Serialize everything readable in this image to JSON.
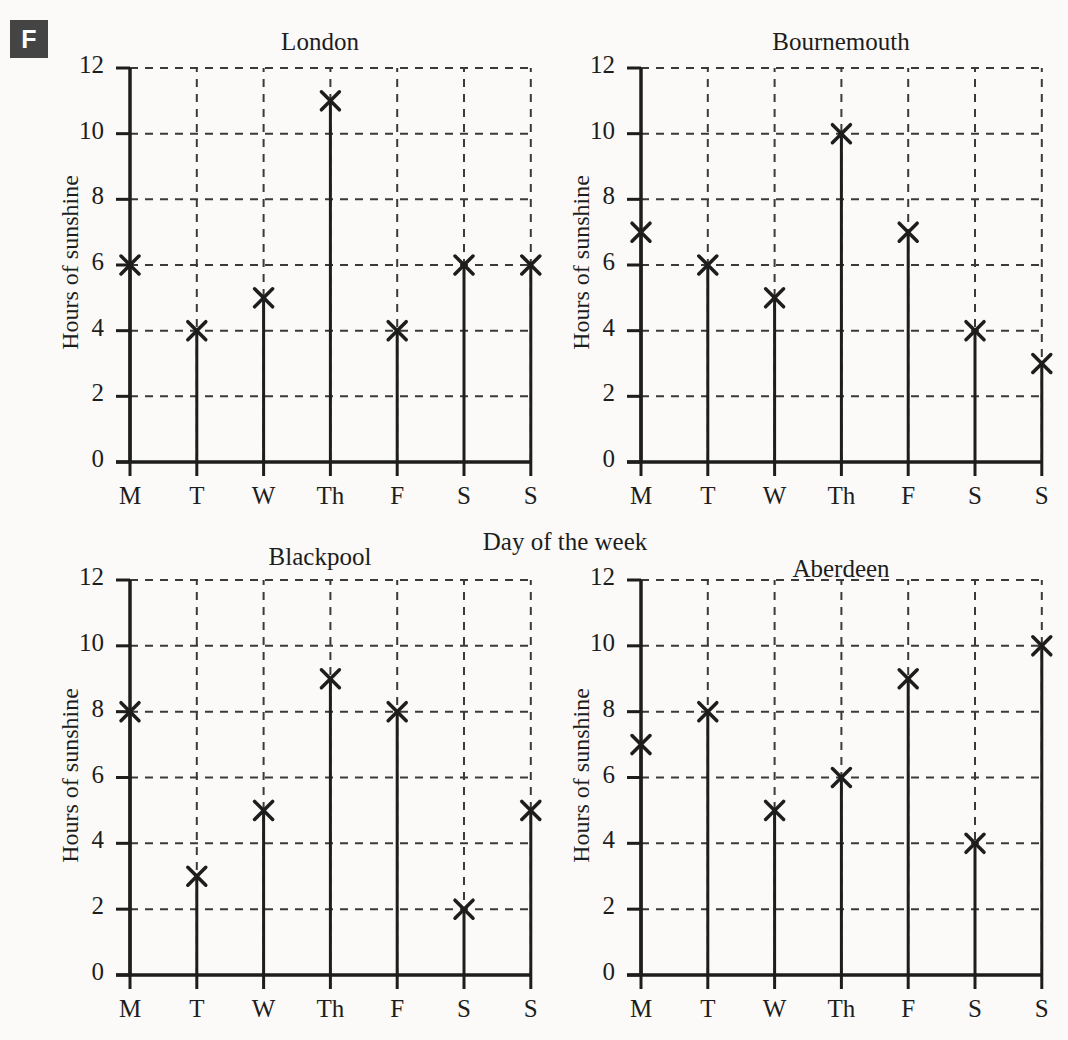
{
  "badge": {
    "label": "F"
  },
  "global": {
    "xaxis_label": "Day of the week",
    "yaxis_label": "Hours of sunshine",
    "categories": [
      "M",
      "T",
      "W",
      "Th",
      "F",
      "S",
      "S"
    ],
    "yticks": [
      "0",
      "2",
      "4",
      "6",
      "8",
      "10",
      "12"
    ],
    "marker": "x-marker",
    "ink_color": "#1d1d1d",
    "grid_color": "#3a3a3a",
    "background": "#fbfaf8",
    "badge_color": "#444444"
  },
  "chart_data": [
    {
      "type": "scatter",
      "title": "London",
      "xlabel": "Day of the week",
      "ylabel": "Hours of sunshine",
      "categories": [
        "M",
        "T",
        "W",
        "Th",
        "F",
        "S",
        "S"
      ],
      "values": [
        6,
        4,
        5,
        11,
        4,
        6,
        6
      ],
      "ylim": [
        0,
        12
      ],
      "ytick_step": 2,
      "grid": true,
      "legend": "none",
      "marker": "x",
      "stems": true
    },
    {
      "type": "scatter",
      "title": "Bournemouth",
      "xlabel": "Day of the week",
      "ylabel": "Hours of sunshine",
      "categories": [
        "M",
        "T",
        "W",
        "Th",
        "F",
        "S",
        "S"
      ],
      "values": [
        7,
        6,
        5,
        10,
        7,
        4,
        3
      ],
      "ylim": [
        0,
        12
      ],
      "ytick_step": 2,
      "grid": true,
      "legend": "none",
      "marker": "x",
      "stems": true
    },
    {
      "type": "scatter",
      "title": "Blackpool",
      "xlabel": "Day of the week",
      "ylabel": "Hours of sunshine",
      "categories": [
        "M",
        "T",
        "W",
        "Th",
        "F",
        "S",
        "S"
      ],
      "values": [
        8,
        3,
        5,
        9,
        8,
        2,
        5
      ],
      "ylim": [
        0,
        12
      ],
      "ytick_step": 2,
      "grid": true,
      "legend": "none",
      "marker": "x",
      "stems": true
    },
    {
      "type": "scatter",
      "title": "Aberdeen",
      "xlabel": "Day of the week",
      "ylabel": "Hours of sunshine",
      "categories": [
        "M",
        "T",
        "W",
        "Th",
        "F",
        "S",
        "S"
      ],
      "values": [
        7,
        8,
        5,
        6,
        9,
        4,
        10
      ],
      "ylim": [
        0,
        12
      ],
      "ytick_step": 2,
      "grid": true,
      "legend": "none",
      "marker": "x",
      "stems": true
    }
  ],
  "panels": [
    {
      "index": 0,
      "title_x": 320,
      "title_y": 28,
      "origin_x": 130,
      "origin_y": 462,
      "top_y": 68,
      "x_step": 66.8,
      "ylabel_cx": 70,
      "ylabel_cy": 265
    },
    {
      "index": 1,
      "title_x": 841,
      "title_y": 28,
      "origin_x": 641,
      "origin_y": 462,
      "top_y": 68,
      "x_step": 66.8,
      "ylabel_cx": 581,
      "ylabel_cy": 265
    },
    {
      "index": 2,
      "title_x": 320,
      "title_y": 543,
      "origin_x": 130,
      "origin_y": 975,
      "top_y": 580,
      "x_step": 66.8,
      "ylabel_cx": 70,
      "ylabel_cy": 778
    },
    {
      "index": 3,
      "title_x": 841,
      "title_y": 555,
      "origin_x": 641,
      "origin_y": 975,
      "top_y": 580,
      "x_step": 66.8,
      "ylabel_cx": 581,
      "ylabel_cy": 778
    }
  ]
}
